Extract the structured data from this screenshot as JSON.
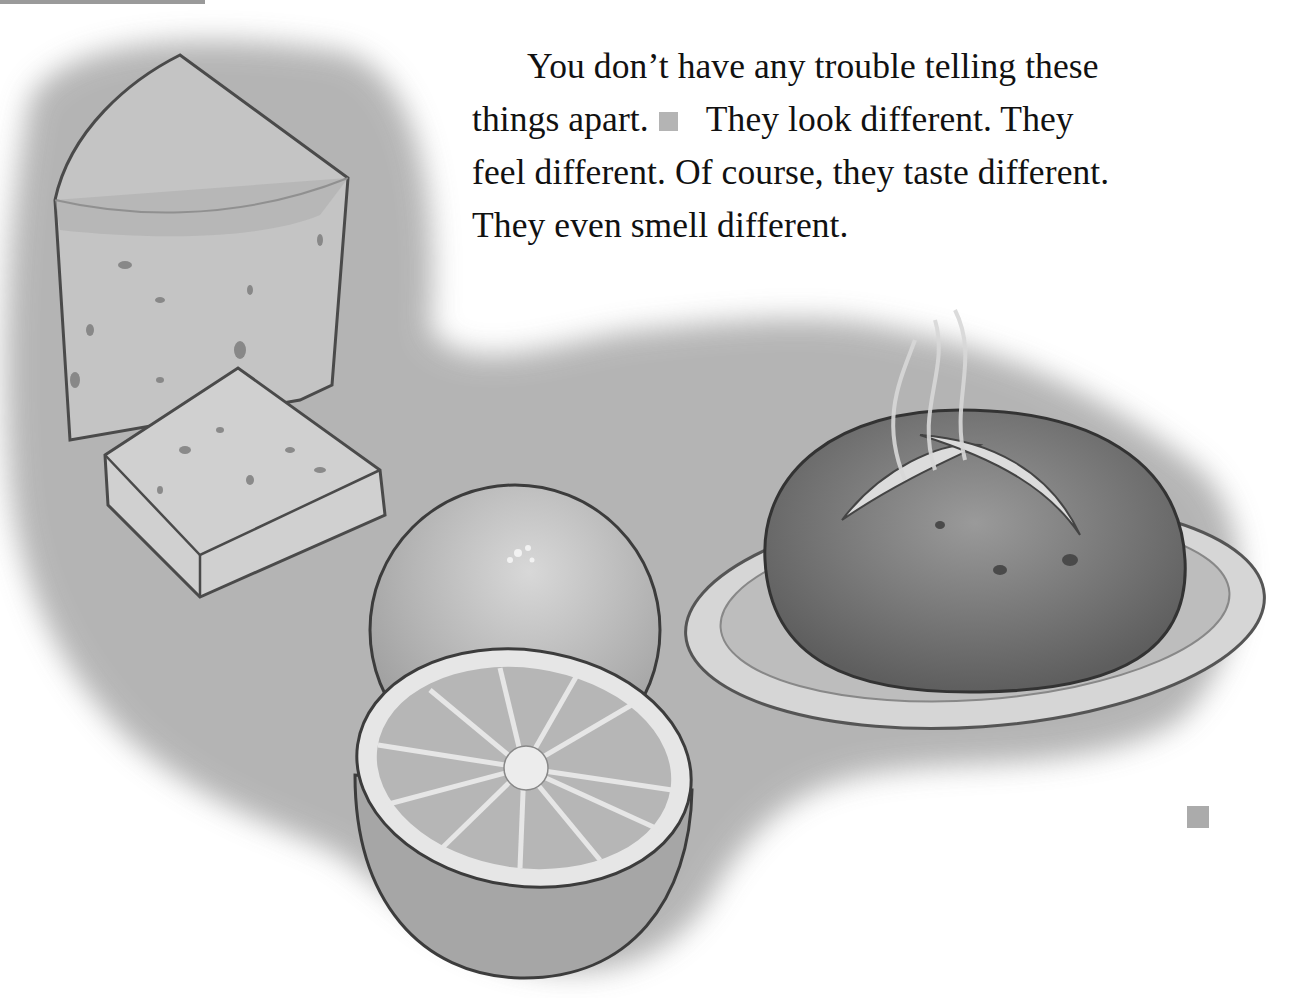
{
  "page": {
    "paragraph": {
      "lines": [
        "You don’t have any trouble telling these",
        "things apart.",
        "They look different. They",
        "feel different. Of course, they taste different.",
        "They even smell different."
      ]
    },
    "illustration": {
      "subjects": [
        "cheese wedge",
        "cheese slice",
        "whole orange",
        "half orange",
        "bread loaf on plate",
        "steam"
      ]
    },
    "colors": {
      "text": "#111111",
      "marker": "#b4b4b4",
      "wash": "#a8a8a8"
    }
  }
}
